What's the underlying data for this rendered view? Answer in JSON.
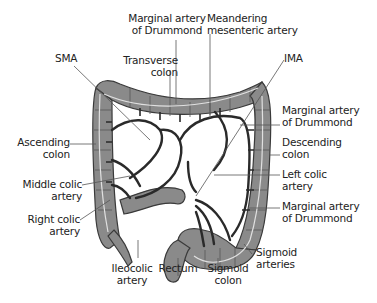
{
  "diagram": {
    "colors": {
      "colon_fill": "#8a8a8a",
      "colon_outline": "#3a3a3a",
      "vessel": "#2a2a2a",
      "marginal_line": "#e0e0e0",
      "leader_line": "#555555",
      "background": "#ffffff",
      "text": "#222222"
    },
    "labels": {
      "marginal_top": [
        "Marginal artery",
        "of Drummond"
      ],
      "meandering": [
        "Meandering",
        "mesenteric artery"
      ],
      "sma": "SMA",
      "transverse": [
        "Transverse",
        "colon"
      ],
      "ima": "IMA",
      "marginal_right_upper": [
        "Marginal artery",
        "of Drummond"
      ],
      "descending": [
        "Descending",
        "colon"
      ],
      "ascending": [
        "Ascending",
        "colon"
      ],
      "left_colic": [
        "Left colic",
        "artery"
      ],
      "middle_colic": [
        "Middle colic",
        "artery"
      ],
      "marginal_right_lower": [
        "Marginal artery",
        "of Drummond"
      ],
      "right_colic": [
        "Right colic",
        "artery"
      ],
      "sigmoid_arteries": [
        "Sigmoid",
        "arteries"
      ],
      "ileocolic": [
        "Ileocolic",
        "artery"
      ],
      "rectum": "Rectum",
      "sigmoid_colon": [
        "Sigmoid",
        "colon"
      ]
    }
  }
}
